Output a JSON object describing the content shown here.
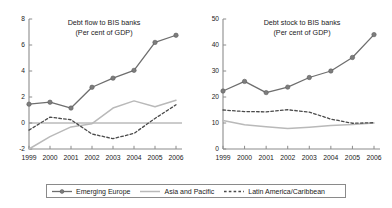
{
  "chart_data": [
    {
      "type": "line",
      "panel": "left",
      "title": "Debt flow to BIS banks",
      "subtitle": "(Per cent of GDP)",
      "xlabel": "",
      "ylabel": "",
      "x": [
        1999,
        2000,
        2001,
        2002,
        2003,
        2004,
        2005,
        2006
      ],
      "xticklabels": [
        "1999",
        "2000",
        "2001",
        "2002",
        "2003",
        "2004",
        "2005",
        "2006"
      ],
      "ylim": [
        -2,
        8
      ],
      "yticks": [
        -2,
        0,
        2,
        4,
        6,
        8
      ],
      "yticklabels": [
        "-2",
        "0",
        "2",
        "4",
        "6",
        "8"
      ],
      "grid": false,
      "zero_line": true,
      "legend_position": "below-figure",
      "series": [
        {
          "name": "Emerging Europe",
          "style": "line-markers",
          "color": "#6e6e6e",
          "values": [
            1.45,
            1.6,
            1.15,
            2.75,
            3.45,
            4.05,
            6.2,
            6.75
          ]
        },
        {
          "name": "Asia and Pacific",
          "style": "solid",
          "color": "#b9b9b9",
          "values": [
            -2.0,
            -1.05,
            -0.3,
            -0.05,
            1.15,
            1.7,
            1.25,
            1.75
          ]
        },
        {
          "name": "Latin America/Caribbean",
          "style": "dashed",
          "color": "#4a4a4a",
          "values": [
            -0.55,
            0.45,
            0.25,
            -0.85,
            -1.2,
            -0.8,
            0.35,
            1.4
          ]
        }
      ]
    },
    {
      "type": "line",
      "panel": "right",
      "title": "Debt stock to BIS banks",
      "subtitle": "(Per cent of GDP)",
      "xlabel": "",
      "ylabel": "",
      "x": [
        1999,
        2000,
        2001,
        2002,
        2003,
        2004,
        2005,
        2006
      ],
      "xticklabels": [
        "1999",
        "2000",
        "2001",
        "2002",
        "2003",
        "2004",
        "2005",
        "2006"
      ],
      "ylim": [
        0,
        50
      ],
      "yticks": [
        0,
        10,
        20,
        30,
        40,
        50
      ],
      "yticklabels": [
        "0",
        "10",
        "20",
        "30",
        "40",
        "50"
      ],
      "grid": false,
      "zero_line": false,
      "legend_position": "below-figure",
      "series": [
        {
          "name": "Emerging Europe",
          "style": "line-markers",
          "color": "#6e6e6e",
          "values": [
            22.3,
            26.0,
            21.7,
            23.8,
            27.5,
            30.0,
            35.2,
            44.0
          ]
        },
        {
          "name": "Asia and Pacific",
          "style": "solid",
          "color": "#b9b9b9",
          "values": [
            11.0,
            9.3,
            8.6,
            7.9,
            8.4,
            9.0,
            9.4,
            10.0
          ]
        },
        {
          "name": "Latin America/Caribbean",
          "style": "dashed",
          "color": "#4a4a4a",
          "values": [
            15.0,
            14.4,
            14.3,
            15.1,
            14.2,
            11.5,
            9.9,
            10.1
          ]
        }
      ]
    }
  ],
  "legend": {
    "entries": [
      {
        "label": "Emerging Europe",
        "style": "line-markers",
        "color": "#6e6e6e"
      },
      {
        "label": "Asia and Pacific",
        "style": "solid",
        "color": "#b9b9b9"
      },
      {
        "label": "Latin America/Caribbean",
        "style": "dashed",
        "color": "#4a4a4a"
      }
    ]
  },
  "colors": {
    "emerging_europe": "#6e6e6e",
    "asia_pacific": "#b9b9b9",
    "latin_america": "#4a4a4a",
    "axis": "#8c8c8c",
    "background": "#ffffff"
  }
}
